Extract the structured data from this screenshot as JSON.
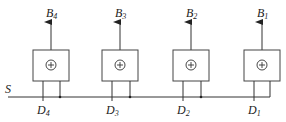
{
  "diagram": {
    "bus_label": "S",
    "cells": [
      {
        "id": "cell-4",
        "output": "B",
        "output_sub": "4",
        "input": "D",
        "input_sub": "4",
        "symbol": "⊕",
        "x": 33
      },
      {
        "id": "cell-3",
        "output": "B",
        "output_sub": "3",
        "input": "D",
        "input_sub": "3",
        "symbol": "⊕",
        "x": 102
      },
      {
        "id": "cell-2",
        "output": "B",
        "output_sub": "2",
        "input": "D",
        "input_sub": "2",
        "symbol": "⊕",
        "x": 173
      },
      {
        "id": "cell-1",
        "output": "B",
        "output_sub": "1",
        "input": "D",
        "input_sub": "1",
        "symbol": "⊕",
        "x": 244
      }
    ]
  }
}
